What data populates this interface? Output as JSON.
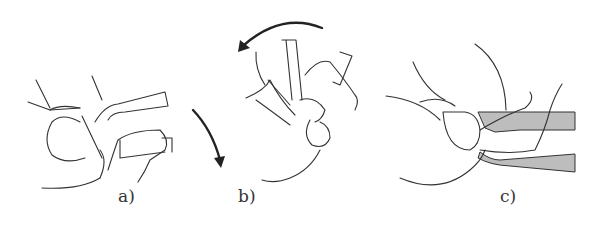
{
  "figure": {
    "panels": [
      {
        "id": "a",
        "label": "a)",
        "description": "infant supported on forearm, face down, arrow indicating rotation downward"
      },
      {
        "id": "b",
        "label": "b)",
        "description": "infant being rotated with both hands, curved arrow indicating turning direction"
      },
      {
        "id": "c",
        "label": "c)",
        "description": "infant lying supine on forearms (shaded), head supported by hand"
      }
    ],
    "colors": {
      "line": "#333333",
      "arm_fill": "#bdbdbd",
      "background": "#ffffff"
    }
  }
}
